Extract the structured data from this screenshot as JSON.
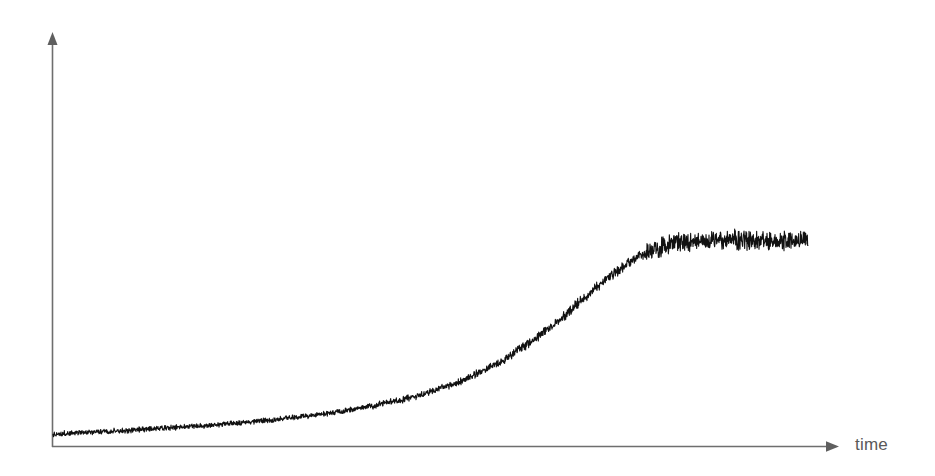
{
  "figure": {
    "title": "",
    "background_color": "#ffffff",
    "width": 935,
    "height": 476
  },
  "axes": {
    "x": {
      "label": "time",
      "label_color": "#595959",
      "line_color": "#6e6e6e",
      "arrow": "arrow-right",
      "ticks": [],
      "tick_labels": []
    },
    "y": {
      "label": "",
      "line_color": "#6e6e6e",
      "arrow": "arrow-up",
      "ticks": [],
      "tick_labels": []
    }
  },
  "series_style": {
    "color": "#111111",
    "line_width": 1.1,
    "noise": "high-frequency measurement noise"
  },
  "chart_data": {
    "type": "line",
    "title": "",
    "xlabel": "time",
    "ylabel": "",
    "grid": false,
    "legend": null,
    "xlim": [
      0,
      100
    ],
    "ylim": [
      0,
      100
    ],
    "annotations": [],
    "series": [
      {
        "name": "signal",
        "description": "Noisy sigmoidal growth curve: slow near-flat baseline, exponential rise, then saturation plateau",
        "color": "#111111",
        "x": [
          0,
          2,
          4,
          6,
          8,
          10,
          12,
          14,
          16,
          18,
          20,
          22,
          24,
          26,
          28,
          30,
          32,
          34,
          36,
          38,
          40,
          42,
          44,
          46,
          48,
          50,
          52,
          54,
          56,
          58,
          60,
          62,
          64,
          66,
          68,
          70,
          72,
          74,
          76,
          78,
          80,
          82,
          84,
          86,
          88,
          90,
          92,
          94,
          96,
          98,
          100
        ],
        "values": [
          3.1,
          3.4,
          3.7,
          4.0,
          4.3,
          4.7,
          5.0,
          5.4,
          5.8,
          6.2,
          6.6,
          7.1,
          7.6,
          8.1,
          8.7,
          9.3,
          10.0,
          10.7,
          11.5,
          12.4,
          13.4,
          14.5,
          15.8,
          17.2,
          18.8,
          20.6,
          22.7,
          25.1,
          27.8,
          30.9,
          34.4,
          38.4,
          42.8,
          47.7,
          52.9,
          58.3,
          63.7,
          68.8,
          73.3,
          77.0,
          79.8,
          81.6,
          82.6,
          83.1,
          83.3,
          83.4,
          83.4,
          83.4,
          83.4,
          83.4,
          83.4
        ],
        "noise_amplitude": {
          "baseline": 0.8,
          "transition": 1.6,
          "plateau": 3.0
        },
        "plateau_value": 83.4,
        "baseline_value": 3.1
      }
    ]
  }
}
